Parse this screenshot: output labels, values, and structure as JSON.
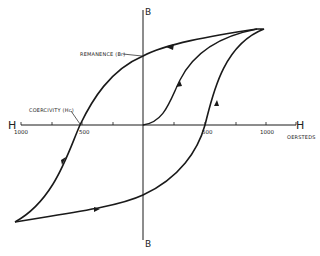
{
  "diagram": {
    "type": "hysteresis-loop",
    "axes": {
      "horizontal_left_label": "H",
      "horizontal_right_label": "H",
      "vertical_top_label": "B",
      "vertical_bottom_label": "B",
      "units_label": "OERSTEDS"
    },
    "tick_labels": {
      "left_1000": "1000",
      "left_500": "500",
      "right_500": "500",
      "right_1000": "1000"
    },
    "annotations": {
      "remanence": "REMANENCE (Br)",
      "coercivity": "COERCIVITY (Hc)"
    },
    "colors": {
      "ink": "#1a1a1a",
      "background": "#ffffff"
    }
  }
}
